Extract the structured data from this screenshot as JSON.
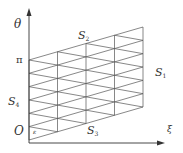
{
  "diagram": {
    "type": "parallelogram-triangulated-grid",
    "axes": {
      "vertical_label": "θ",
      "horizontal_label": "ξ",
      "origin_label": "O",
      "vertical_tick_label": "π"
    },
    "regions": [
      {
        "id": "S2",
        "base": "S",
        "sub": "2",
        "position": "top"
      },
      {
        "id": "S1",
        "base": "S",
        "sub": "1",
        "position": "right"
      },
      {
        "id": "S3",
        "base": "S",
        "sub": "3",
        "position": "bottom"
      },
      {
        "id": "S4",
        "base": "S",
        "sub": "4",
        "position": "left"
      }
    ],
    "corner_label": "ε",
    "grid": {
      "columns": 4,
      "rows": 6,
      "left_x": 29,
      "right_x": 143,
      "left_bottom_y": 140,
      "left_top_y": 60,
      "right_shift_y": -33
    },
    "colors": {
      "line": "#555555",
      "axis": "#333333",
      "text": "#333333",
      "background": "#ffffff"
    }
  }
}
